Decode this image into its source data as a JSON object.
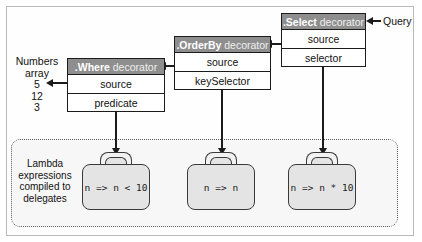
{
  "diagram": {
    "source": {
      "label_line1": "Numbers",
      "label_line2": "array",
      "values": [
        "5",
        "12",
        "3"
      ]
    },
    "query_label": "Query",
    "decorators": [
      {
        "id": "where",
        "name": ".Where",
        "suffix": "decorator",
        "rows": [
          "source",
          "predicate"
        ]
      },
      {
        "id": "orderby",
        "name": ".OrderBy",
        "suffix": "decorator",
        "rows": [
          "source",
          "keySelector"
        ]
      },
      {
        "id": "select",
        "name": ".Select",
        "suffix": "decorator",
        "rows": [
          "source",
          "selector"
        ]
      }
    ],
    "lambda_region": {
      "caption_lines": [
        "Lambda",
        "expressions",
        "compiled to",
        "delegates"
      ],
      "briefcases": [
        {
          "id": "predicate-lambda",
          "expression": "n => n < 10"
        },
        {
          "id": "keyselector-lambda",
          "expression": "n => n"
        },
        {
          "id": "selector-lambda",
          "expression": "n => n * 10"
        }
      ]
    },
    "colors": {
      "header_gray": "#8e8e8e",
      "stroke": "#1b1b1b",
      "briefcase_fill": "#e4e4e4",
      "region_fill": "#f7f7f7"
    }
  }
}
